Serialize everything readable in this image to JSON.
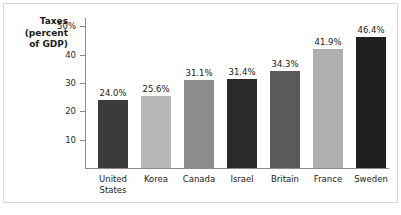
{
  "chart_data": {
    "type": "bar",
    "title": "",
    "ylabel": "Taxes (percent of GDP)",
    "ylabel_lines": [
      "Taxes",
      "(percent",
      "of GDP)"
    ],
    "xlabel": "",
    "categories": [
      "United States",
      "Korea",
      "Canada",
      "Israel",
      "Britain",
      "France",
      "Sweden"
    ],
    "category_lines": [
      [
        "United",
        "States"
      ],
      [
        "Korea"
      ],
      [
        "Canada"
      ],
      [
        "Israel"
      ],
      [
        "Britain"
      ],
      [
        "France"
      ],
      [
        "Sweden"
      ]
    ],
    "values": [
      24.0,
      25.6,
      31.1,
      31.4,
      34.3,
      41.9,
      46.4
    ],
    "value_labels": [
      "24.0%",
      "25.6%",
      "31.1%",
      "31.4%",
      "34.3%",
      "41.9%",
      "46.4%"
    ],
    "bar_colors": [
      "#3b3b3b",
      "#b6b6b6",
      "#8c8c8c",
      "#2a2a2a",
      "#5a5a5a",
      "#b0b0b0",
      "#1f1f1f"
    ],
    "ylim": [
      0,
      53
    ],
    "yticks": [
      10,
      20,
      30,
      40,
      50
    ],
    "ytick_labels": [
      "10",
      "20",
      "30",
      "40",
      "50%"
    ],
    "grid": false,
    "legend": "none",
    "axis_color": "#8a8a8a",
    "background_color": "#ffffff",
    "border_color": "#d8d8d8"
  }
}
